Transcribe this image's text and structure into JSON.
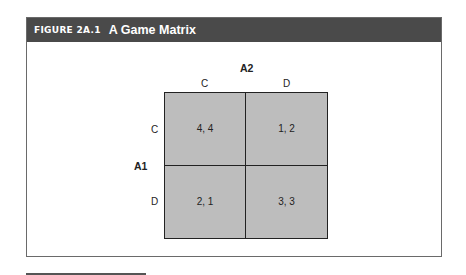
{
  "figure": {
    "number": "FIGURE 2A.1",
    "title": "A Game Matrix"
  },
  "matrix": {
    "column_player": "A2",
    "row_player": "A1",
    "column_strategies": [
      "C",
      "D"
    ],
    "row_strategies": [
      "C",
      "D"
    ],
    "payoffs": [
      [
        "4, 4",
        "1, 2"
      ],
      [
        "2, 1",
        "3, 3"
      ]
    ]
  },
  "colors": {
    "header_bg": "#4a4a4a",
    "cell_fill": "#bdbdbd",
    "border": "#222222"
  }
}
